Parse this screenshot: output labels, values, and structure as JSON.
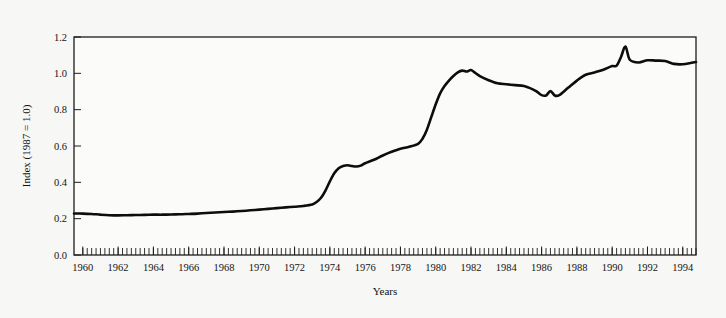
{
  "figure": {
    "name": "energy-price-index-line-chart",
    "background_color": "#f7f7f6",
    "line_color": "#0d0d0d",
    "axis_color": "#1d1d1d"
  },
  "chart_data": {
    "type": "line",
    "title": "",
    "subtitle": "",
    "xlabel": "Years",
    "ylabel": "Index (1987 = 1.0)",
    "xlim": [
      1959.5,
      1994.75
    ],
    "ylim": [
      0.0,
      1.2
    ],
    "grid": false,
    "legend": null,
    "legend_position": "none",
    "x_tick_labels": [
      "1960",
      "1962",
      "1964",
      "1966",
      "1968",
      "1970",
      "1972",
      "1974",
      "1976",
      "1978",
      "1980",
      "1982",
      "1984",
      "1986",
      "1988",
      "1990",
      "1992",
      "1994"
    ],
    "x_tick_values": [
      1960,
      1962,
      1964,
      1966,
      1968,
      1970,
      1972,
      1974,
      1976,
      1978,
      1980,
      1982,
      1984,
      1986,
      1988,
      1990,
      1992,
      1994
    ],
    "x_minor_tick_interval": 0.25,
    "y_tick_labels": [
      "0.0",
      "0.2",
      "0.4",
      "0.6",
      "0.8",
      "1.0",
      "1.2"
    ],
    "y_tick_values": [
      0.0,
      0.2,
      0.4,
      0.6,
      0.8,
      1.0,
      1.2
    ],
    "series": [
      {
        "name": "Index (1987 = 1.0)",
        "x": [
          1959.5,
          1960.0,
          1960.5,
          1961.0,
          1961.5,
          1962.0,
          1962.5,
          1963.0,
          1963.5,
          1964.0,
          1964.5,
          1965.0,
          1965.5,
          1966.0,
          1966.5,
          1967.0,
          1967.5,
          1968.0,
          1968.5,
          1969.0,
          1969.5,
          1970.0,
          1970.5,
          1971.0,
          1971.5,
          1972.0,
          1972.5,
          1973.0,
          1973.25,
          1973.5,
          1973.75,
          1974.0,
          1974.25,
          1974.5,
          1974.75,
          1975.0,
          1975.25,
          1975.5,
          1975.75,
          1976.0,
          1976.5,
          1977.0,
          1977.5,
          1978.0,
          1978.5,
          1979.0,
          1979.25,
          1979.5,
          1979.75,
          1980.0,
          1980.25,
          1980.5,
          1980.75,
          1981.0,
          1981.25,
          1981.5,
          1981.75,
          1982.0,
          1982.25,
          1982.5,
          1983.0,
          1983.5,
          1984.0,
          1984.5,
          1985.0,
          1985.5,
          1985.75,
          1986.0,
          1986.25,
          1986.5,
          1986.75,
          1987.0,
          1987.5,
          1988.0,
          1988.5,
          1989.0,
          1989.5,
          1990.0,
          1990.25,
          1990.5,
          1990.75,
          1991.0,
          1991.5,
          1992.0,
          1992.5,
          1993.0,
          1993.5,
          1994.0,
          1994.5,
          1994.75
        ],
        "values": [
          0.228,
          0.228,
          0.226,
          0.222,
          0.219,
          0.218,
          0.219,
          0.22,
          0.221,
          0.222,
          0.222,
          0.223,
          0.224,
          0.226,
          0.228,
          0.231,
          0.234,
          0.237,
          0.239,
          0.242,
          0.246,
          0.25,
          0.254,
          0.258,
          0.262,
          0.266,
          0.27,
          0.278,
          0.292,
          0.315,
          0.355,
          0.405,
          0.45,
          0.478,
          0.49,
          0.494,
          0.49,
          0.487,
          0.492,
          0.505,
          0.524,
          0.548,
          0.568,
          0.585,
          0.596,
          0.612,
          0.64,
          0.69,
          0.76,
          0.83,
          0.89,
          0.93,
          0.96,
          0.985,
          1.005,
          1.015,
          1.01,
          1.018,
          1.002,
          0.985,
          0.962,
          0.945,
          0.94,
          0.935,
          0.93,
          0.912,
          0.898,
          0.88,
          0.878,
          0.902,
          0.878,
          0.88,
          0.92,
          0.96,
          0.992,
          1.005,
          1.02,
          1.04,
          1.042,
          1.09,
          1.148,
          1.075,
          1.06,
          1.072,
          1.07,
          1.068,
          1.052,
          1.05,
          1.058,
          1.062
        ]
      }
    ],
    "annotations": []
  }
}
